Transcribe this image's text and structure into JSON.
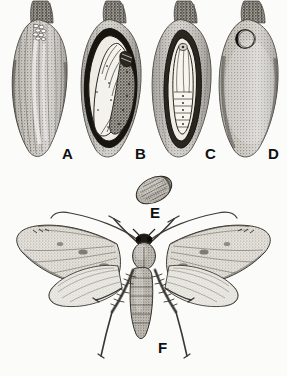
{
  "plate": {
    "kind": "scientific-illustration-halftone",
    "subject": "Life stages of a boll-infesting moth in cotton bolls",
    "background_color": "#fbfbfa",
    "ink_color": "#2b2b2b",
    "width": 287,
    "height": 376,
    "panel_count": 6
  },
  "figures": [
    {
      "key": "A",
      "label": "A",
      "caption": "Cotton boll with eggs deposited near the stem end",
      "stage": "egg",
      "shape": "intact-boll",
      "label_x": 62,
      "label_y": 146
    },
    {
      "key": "B",
      "label": "B",
      "caption": "Boll cut open showing larva (grub) coiled inside",
      "stage": "larva",
      "shape": "sectioned-boll",
      "label_x": 135,
      "label_y": 146
    },
    {
      "key": "C",
      "label": "C",
      "caption": "Boll cut open showing pupa in its cell",
      "stage": "pupa",
      "shape": "sectioned-boll",
      "label_x": 205,
      "label_y": 146
    },
    {
      "key": "D",
      "label": "D",
      "caption": "Boll with circular exit hole made by emerging adult",
      "stage": "exit-hole",
      "shape": "intact-boll",
      "label_x": 268,
      "label_y": 146
    },
    {
      "key": "E",
      "label": "E",
      "caption": "Pupa removed from boll, side view",
      "stage": "pupa",
      "shape": "free-pupa",
      "label_x": 150,
      "label_y": 205
    },
    {
      "key": "F",
      "label": "F",
      "caption": "Adult moth, wings spread, dorsal view",
      "stage": "adult",
      "shape": "moth",
      "label_x": 158,
      "label_y": 340
    }
  ]
}
